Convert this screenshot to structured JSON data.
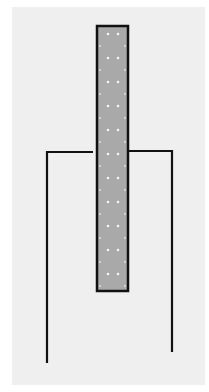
{
  "diagram": {
    "colors": {
      "background": "#efefef",
      "strip_fill": "#a9a9a9",
      "strip_border": "#111111",
      "strip_dots": "#f4f4f4",
      "container_line": "#111111"
    },
    "strip": {
      "x": 97,
      "y": 26,
      "width": 31,
      "height": 265
    },
    "container": {
      "left_wall": {
        "x": 47,
        "top": 151,
        "bottom": 363,
        "rim_end_x": 93
      },
      "right_wall": {
        "x": 172,
        "top": 150,
        "bottom": 352,
        "rim_start_x": 128
      }
    }
  }
}
